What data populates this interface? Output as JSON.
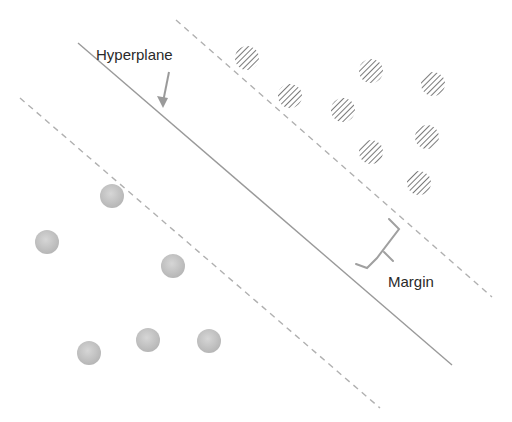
{
  "diagram": {
    "type": "svm-margin",
    "labels": {
      "hyperplane": "Hyperplane",
      "margin": "Margin"
    },
    "colors": {
      "background": "#ffffff",
      "line": "#9a9a9a",
      "dashed": "#b0b0b0",
      "hatched_class": "#7a7a7a",
      "solid_class": "#c4c4c4",
      "text": "#2a2a2a"
    },
    "lines": {
      "hyperplane": {
        "x1": 78,
        "y1": 43,
        "x2": 452,
        "y2": 365
      },
      "upper_margin": {
        "x1": 176,
        "y1": 20,
        "x2": 492,
        "y2": 297
      },
      "lower_margin": {
        "x1": 20,
        "y1": 98,
        "x2": 380,
        "y2": 408
      }
    },
    "hatched_points": [
      {
        "x": 247,
        "y": 58
      },
      {
        "x": 290,
        "y": 96
      },
      {
        "x": 371,
        "y": 71
      },
      {
        "x": 433,
        "y": 84
      },
      {
        "x": 343,
        "y": 110
      },
      {
        "x": 371,
        "y": 152
      },
      {
        "x": 427,
        "y": 137
      },
      {
        "x": 419,
        "y": 183
      }
    ],
    "solid_points": [
      {
        "x": 112,
        "y": 196
      },
      {
        "x": 47,
        "y": 242
      },
      {
        "x": 173,
        "y": 266
      },
      {
        "x": 89,
        "y": 353
      },
      {
        "x": 148,
        "y": 340
      },
      {
        "x": 209,
        "y": 341
      }
    ],
    "point_radius": 12
  }
}
